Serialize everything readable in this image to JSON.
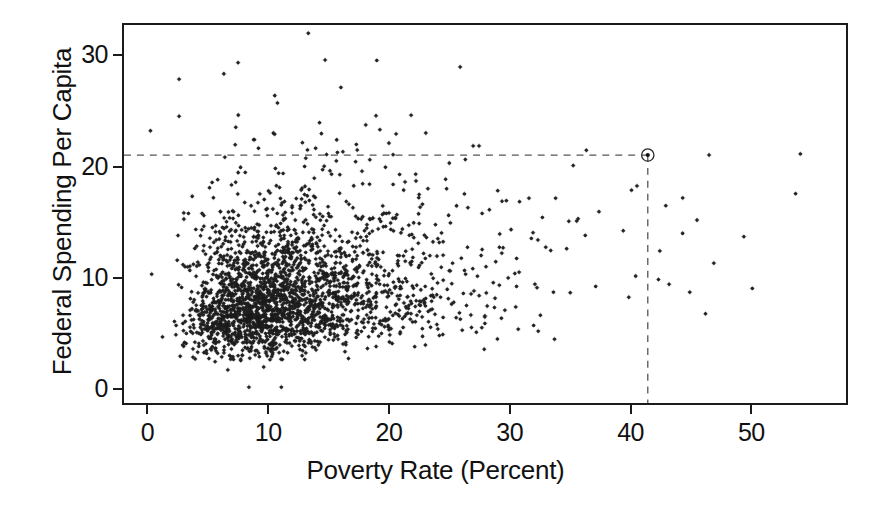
{
  "chart_data": {
    "type": "scatter",
    "title": "",
    "xlabel": "Poverty Rate (Percent)",
    "ylabel": "Federal Spending Per Capita",
    "xlim": [
      -2.1,
      58.0
    ],
    "ylim": [
      -1.4,
      32.9
    ],
    "xticks": [
      0,
      10,
      20,
      30,
      40,
      50
    ],
    "yticks": [
      0,
      10,
      20,
      30
    ],
    "xticklabels": [
      "0",
      "10",
      "20",
      "30",
      "40",
      "50"
    ],
    "yticklabels": [
      "0",
      "10",
      "20",
      "30"
    ],
    "grid": false,
    "legend": null,
    "marker": "asterisk-dot",
    "marker_color": "#1a1a1a",
    "n_points_shown": 2540,
    "annotations": [
      {
        "name": "excluded-counties-note",
        "lines": [
          "32 counties with higher",
          "federal spending are not shown"
        ],
        "x": 45.5,
        "y": 30.3
      }
    ],
    "highlight_point": {
      "label": "",
      "x": 41.5,
      "y": 21.1,
      "marker": "circled-dot",
      "guides": [
        "horizontal-dashed-to-y-axis",
        "vertical-dashed-to-x-axis"
      ]
    },
    "guides": {
      "horizontal_dashed_y": 21.1,
      "vertical_dashed_x": 41.5,
      "dash_color": "#555555"
    },
    "cloud_description": {
      "core_x_range": [
        4,
        30
      ],
      "core_y_range": [
        3,
        14
      ],
      "densest_x": 12,
      "densest_y": 8,
      "upper_sparse_y_range": [
        20,
        32
      ],
      "right_sparse_x_range": [
        36,
        55
      ]
    }
  },
  "figure": {
    "background": "#ffffff",
    "frame_color": "#1b1b1b"
  }
}
